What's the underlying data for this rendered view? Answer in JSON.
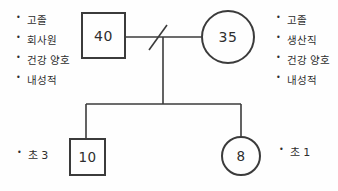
{
  "colors": {
    "line": "#3b3b3b",
    "text": "#2e2e2e",
    "background": "#fefefe"
  },
  "diagram": {
    "bullet_char": "•",
    "father": {
      "age": "40",
      "attributes": [
        "고졸",
        "회사원",
        "건강 양호",
        "내성적"
      ]
    },
    "mother": {
      "age": "35",
      "attributes": [
        "고졸",
        "생산직",
        "건강 양호",
        "내성적"
      ]
    },
    "children": [
      {
        "age": "10",
        "grade_label": "초 3"
      },
      {
        "age": "8",
        "grade_label": "초 1"
      }
    ]
  }
}
